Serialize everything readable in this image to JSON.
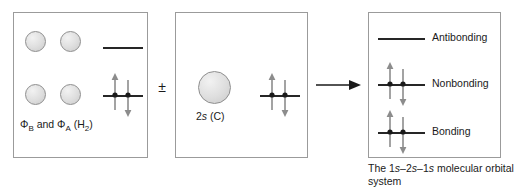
{
  "figure": {
    "caption": "The 1s–2s–1s molecular orbital system",
    "operator_plus_minus": "±",
    "arrow": "right-arrow"
  },
  "panels": [
    {
      "id": "h2-orbitals",
      "label": "Φ<sub>B</sub> and Φ<sub>A</sub> (H<sub>2</sub>)",
      "label_plain": "ΦB and ΦA (H2)",
      "orbitals": [
        {
          "name": "phi-b-upper",
          "type": "1s",
          "size": "small"
        },
        {
          "name": "phi-a-upper",
          "type": "1s",
          "size": "small"
        },
        {
          "name": "phi-b-lower",
          "type": "1s",
          "size": "small"
        },
        {
          "name": "phi-a-lower",
          "type": "1s",
          "size": "small"
        }
      ],
      "levels": [
        {
          "name": "upper-empty-level",
          "occupancy": 0
        },
        {
          "name": "lower-filled-level",
          "occupancy": 2
        }
      ]
    },
    {
      "id": "carbon-2s",
      "label": "2s (C)",
      "label_italic_part": "s",
      "orbitals": [
        {
          "name": "carbon-2s",
          "type": "2s",
          "size": "large"
        }
      ],
      "levels": [
        {
          "name": "carbon-2s-level",
          "occupancy": 2
        }
      ]
    },
    {
      "id": "molecular-orbitals",
      "levels": [
        {
          "name": "antibonding-level",
          "label": "Antibonding",
          "occupancy": 0
        },
        {
          "name": "nonbonding-level",
          "label": "Nonbonding",
          "occupancy": 2
        },
        {
          "name": "bonding-level",
          "label": "Bonding",
          "occupancy": 2
        }
      ]
    }
  ],
  "colors": {
    "panel_border": "#9b9b9b",
    "level_line": "#262626",
    "electron_arrow": "#8c8c8c",
    "electron_dot": "#1a1a1a",
    "orbital_fill": "#dedede",
    "text": "#1a1a1a"
  }
}
